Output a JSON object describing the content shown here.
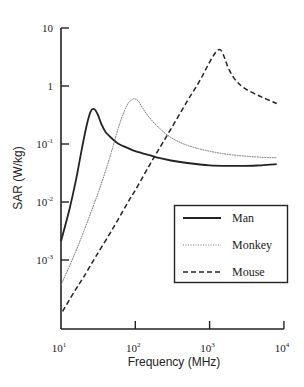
{
  "chart_data": {
    "type": "line",
    "title": "",
    "xlabel": "Frequency (MHz)",
    "ylabel": "SAR (W/kg)",
    "xscale": "log",
    "yscale": "log",
    "xlim": [
      10,
      10000
    ],
    "ylim": [
      6.5e-05,
      10
    ],
    "grid": false,
    "legend_position": "lower right",
    "x_ticks": [
      {
        "value": 10,
        "base": "10",
        "exp": "1"
      },
      {
        "value": 100,
        "base": "10",
        "exp": "2"
      },
      {
        "value": 1000,
        "base": "10",
        "exp": "3"
      },
      {
        "value": 10000,
        "base": "10",
        "exp": "4"
      }
    ],
    "y_ticks": [
      {
        "value": 10,
        "base": "10",
        "exp": ""
      },
      {
        "value": 1,
        "base": "1",
        "exp": ""
      },
      {
        "value": 0.1,
        "base": "10",
        "exp": "-1"
      },
      {
        "value": 0.01,
        "base": "10",
        "exp": "-2"
      },
      {
        "value": 0.001,
        "base": "10",
        "exp": "-3"
      }
    ],
    "series": [
      {
        "name": "Man",
        "style": "solid",
        "color": "#222222",
        "width": 1.8,
        "x": [
          10,
          13,
          16,
          19,
          22,
          25,
          28,
          31,
          35,
          40,
          50,
          60,
          80,
          100,
          150,
          200,
          300,
          500,
          1000,
          2000,
          3000,
          5000,
          8000
        ],
        "y": [
          0.0021,
          0.0075,
          0.025,
          0.08,
          0.2,
          0.36,
          0.4,
          0.33,
          0.22,
          0.16,
          0.12,
          0.1,
          0.085,
          0.075,
          0.065,
          0.058,
          0.052,
          0.047,
          0.043,
          0.042,
          0.042,
          0.043,
          0.045
        ]
      },
      {
        "name": "Monkey",
        "style": "dotted",
        "color": "#777777",
        "width": 1.0,
        "x": [
          10,
          15,
          20,
          30,
          40,
          50,
          60,
          70,
          80,
          90,
          98,
          110,
          125,
          150,
          200,
          300,
          500,
          1000,
          2000,
          5000,
          8000
        ],
        "y": [
          0.00037,
          0.0012,
          0.003,
          0.012,
          0.035,
          0.09,
          0.2,
          0.35,
          0.5,
          0.58,
          0.6,
          0.55,
          0.42,
          0.3,
          0.2,
          0.13,
          0.095,
          0.075,
          0.065,
          0.059,
          0.058
        ]
      },
      {
        "name": "Mouse",
        "style": "dashed",
        "color": "#222222",
        "width": 1.5,
        "x": [
          10.5,
          15,
          20,
          30,
          50,
          80,
          100,
          150,
          200,
          300,
          500,
          700,
          900,
          1100,
          1300,
          1450,
          1600,
          1800,
          2200,
          3000,
          5000,
          8000
        ],
        "y": [
          0.00013,
          0.00028,
          0.0005,
          0.0012,
          0.0035,
          0.01,
          0.016,
          0.04,
          0.075,
          0.18,
          0.55,
          1.1,
          2.0,
          3.2,
          4.2,
          4.0,
          3.0,
          2.0,
          1.3,
          0.9,
          0.65,
          0.5
        ]
      }
    ]
  },
  "legend": {
    "items": [
      {
        "label": "Man",
        "style": "solid"
      },
      {
        "label": "Monkey",
        "style": "dotted"
      },
      {
        "label": "Mouse",
        "style": "dashed"
      }
    ]
  },
  "axes": {
    "xlabel": "Frequency (MHz)",
    "ylabel": "SAR (W/kg)"
  }
}
